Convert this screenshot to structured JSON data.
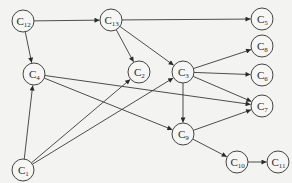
{
  "diagram": {
    "type": "directed-graph",
    "node_radius": 11,
    "colors": {
      "background": "#f3f3f1",
      "stroke": "#3a3a3a",
      "node_fill": "#f6f6f4"
    },
    "nodes": [
      {
        "id": "C12",
        "base": "C",
        "sub": "12",
        "x": 23,
        "y": 21
      },
      {
        "id": "C13",
        "base": "C",
        "sub": "13",
        "x": 111,
        "y": 20
      },
      {
        "id": "C5",
        "base": "C",
        "sub": "5",
        "x": 262,
        "y": 19
      },
      {
        "id": "C8",
        "base": "C",
        "sub": "8",
        "x": 262,
        "y": 46
      },
      {
        "id": "C6",
        "base": "C",
        "sub": "6",
        "x": 262,
        "y": 75
      },
      {
        "id": "C7",
        "base": "C",
        "sub": "7",
        "x": 262,
        "y": 106
      },
      {
        "id": "C4",
        "base": "C",
        "sub": "4",
        "x": 34,
        "y": 74
      },
      {
        "id": "C2",
        "base": "C",
        "sub": "2",
        "x": 139,
        "y": 72
      },
      {
        "id": "C3",
        "base": "C",
        "sub": "3",
        "x": 183,
        "y": 72
      },
      {
        "id": "C9",
        "base": "C",
        "sub": "9",
        "x": 183,
        "y": 134
      },
      {
        "id": "C10",
        "base": "C",
        "sub": "10",
        "x": 237,
        "y": 162
      },
      {
        "id": "C11",
        "base": "C",
        "sub": "11",
        "x": 278,
        "y": 162
      },
      {
        "id": "C1",
        "base": "C",
        "sub": "1",
        "x": 23,
        "y": 170
      }
    ],
    "edges": [
      {
        "from": "C12",
        "to": "C13"
      },
      {
        "from": "C12",
        "to": "C4"
      },
      {
        "from": "C13",
        "to": "C5"
      },
      {
        "from": "C13",
        "to": "C2"
      },
      {
        "from": "C13",
        "to": "C3"
      },
      {
        "from": "C3",
        "to": "C8"
      },
      {
        "from": "C3",
        "to": "C6"
      },
      {
        "from": "C3",
        "to": "C7"
      },
      {
        "from": "C3",
        "to": "C9"
      },
      {
        "from": "C4",
        "to": "C7"
      },
      {
        "from": "C4",
        "to": "C9"
      },
      {
        "from": "C1",
        "to": "C4"
      },
      {
        "from": "C1",
        "to": "C2"
      },
      {
        "from": "C1",
        "to": "C3"
      },
      {
        "from": "C9",
        "to": "C7"
      },
      {
        "from": "C9",
        "to": "C10"
      },
      {
        "from": "C10",
        "to": "C11"
      }
    ]
  }
}
